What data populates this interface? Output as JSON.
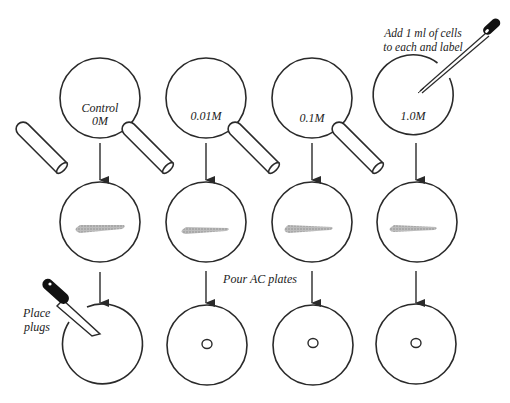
{
  "diagram": {
    "title": "",
    "colors": {
      "stroke": "#2a2a2a",
      "residue": "#a9a9a9",
      "background": "#ffffff"
    },
    "annotations": {
      "add_cells_line1": "Add 1 ml of cells",
      "add_cells_line2": "to each and label",
      "pour_plates": "Pour AC plates",
      "place_plugs_line1": "Place",
      "place_plugs_line2": "plugs"
    },
    "columns": [
      {
        "id": "control",
        "label_line1": "Control",
        "label_line2": "0M",
        "row3_plug": false
      },
      {
        "id": "c001",
        "label_line1": "",
        "label_line2": "0.01M",
        "row3_plug": true
      },
      {
        "id": "c01",
        "label_line1": "",
        "label_line2": "0.1M",
        "row3_plug": true
      },
      {
        "id": "c10",
        "label_line1": "",
        "label_line2": "1.0M",
        "row3_plug": true
      }
    ],
    "rows": [
      {
        "id": "row1",
        "description": "Tubes with concentrations, cells added"
      },
      {
        "id": "row2",
        "description": "Pour tube contents into plates"
      },
      {
        "id": "row3",
        "description": "AC plates with plugs"
      }
    ],
    "icons": [
      "pipette-icon",
      "test-tube-icon",
      "plug-tool-icon",
      "arrow-down-icon",
      "plug-hole-icon"
    ]
  }
}
